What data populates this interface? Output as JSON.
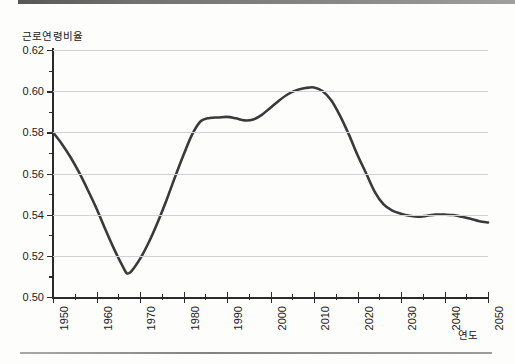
{
  "chart_data": {
    "type": "line",
    "title": "",
    "ylabel": "근로연령비율",
    "xlabel": "연도",
    "xlim": [
      1950,
      2050
    ],
    "ylim": [
      0.5,
      0.62
    ],
    "grid": true,
    "legend": null,
    "y_ticks": [
      "0.50",
      "0.52",
      "0.54",
      "0.56",
      "0.58",
      "0.60",
      "0.62"
    ],
    "y_tick_values": [
      0.5,
      0.52,
      0.54,
      0.56,
      0.58,
      0.6,
      0.62
    ],
    "y_minor_ticks": [
      0.51,
      0.53,
      0.55,
      0.57,
      0.59,
      0.61
    ],
    "x_ticks": [
      "1950",
      "1960",
      "1970",
      "1980",
      "1990",
      "2000",
      "2010",
      "2020",
      "2030",
      "2040",
      "2050"
    ],
    "x_tick_values": [
      1950,
      1960,
      1970,
      1980,
      1990,
      2000,
      2010,
      2020,
      2030,
      2040,
      2050
    ],
    "x_minor_ticks": [
      1955,
      1965,
      1975,
      1985,
      1995,
      2005,
      2015,
      2025,
      2035,
      2045
    ],
    "line_color": "#3a3a3a",
    "x": [
      1950,
      1952,
      1954,
      1956,
      1958,
      1960,
      1962,
      1964,
      1966,
      1967,
      1968,
      1970,
      1972,
      1974,
      1976,
      1978,
      1980,
      1982,
      1984,
      1986,
      1988,
      1990,
      1992,
      1994,
      1996,
      1998,
      2000,
      2002,
      2004,
      2006,
      2008,
      2010,
      2012,
      2014,
      2016,
      2018,
      2020,
      2022,
      2024,
      2026,
      2028,
      2030,
      2032,
      2034,
      2036,
      2038,
      2040,
      2042,
      2044,
      2046,
      2048,
      2050
    ],
    "values": [
      0.58,
      0.5745,
      0.568,
      0.5605,
      0.552,
      0.543,
      0.533,
      0.5235,
      0.515,
      0.5115,
      0.5125,
      0.5185,
      0.5265,
      0.536,
      0.5465,
      0.558,
      0.569,
      0.579,
      0.5855,
      0.587,
      0.5872,
      0.5875,
      0.5868,
      0.5858,
      0.5862,
      0.5885,
      0.592,
      0.5955,
      0.5985,
      0.6005,
      0.6015,
      0.6018,
      0.6,
      0.5955,
      0.588,
      0.579,
      0.569,
      0.56,
      0.551,
      0.545,
      0.542,
      0.5405,
      0.5395,
      0.539,
      0.5395,
      0.54,
      0.54,
      0.5398,
      0.539,
      0.538,
      0.5368,
      0.5362
    ]
  },
  "axes": {
    "y_title": "근로연령비율",
    "x_title": "연도"
  }
}
